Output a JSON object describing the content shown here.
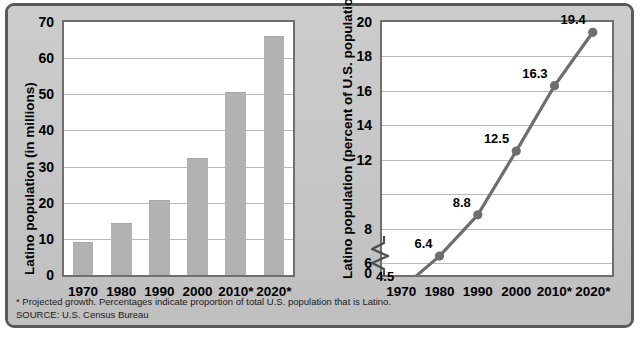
{
  "figure": {
    "background_color": "#c9c9c9",
    "frame_color": "#5a5a5c",
    "footnote_line1": "* Projected growth. Percentages indicate proportion of total U.S. population that is Latino.",
    "footnote_line2": "SOURCE: U.S. Census Bureau"
  },
  "chart_data": [
    {
      "type": "bar",
      "title": "",
      "xlabel": "",
      "ylabel": "Latino population (in millions)",
      "categories": [
        "1970",
        "1980",
        "1990",
        "2000",
        "2010*",
        "2020*"
      ],
      "values": [
        9,
        14,
        20.5,
        32,
        50.5,
        66
      ],
      "ylim": [
        0,
        70
      ],
      "yticks": [
        0,
        10,
        20,
        30,
        40,
        50,
        60,
        70
      ],
      "ytick_labels": [
        "0",
        "10",
        "20",
        "30",
        "40",
        "50",
        "60",
        "70"
      ],
      "grid": true,
      "legend": "none",
      "bar_color": "#b2b2b2",
      "plot_background": "#ffffff",
      "axis_color": "#6f6f70"
    },
    {
      "type": "line",
      "title": "",
      "xlabel": "",
      "ylabel": "Latino population (percent of U.S. population)",
      "categories": [
        "1970",
        "1980",
        "1990",
        "2000",
        "2010*",
        "2020*"
      ],
      "values": [
        4.5,
        6.4,
        8.8,
        12.5,
        16.3,
        19.4
      ],
      "point_labels": [
        "4.5",
        "6.4",
        "8.8",
        "12.5",
        "16.3",
        "19.4"
      ],
      "ylim": [
        5.3,
        20
      ],
      "yticks": [
        6,
        8,
        10,
        12,
        14,
        16,
        18,
        20
      ],
      "ytick_labels": [
        "6",
        "8",
        "",
        "12",
        "14",
        "16",
        "18",
        "20"
      ],
      "axis_break": true,
      "axis_break_label": "0",
      "grid": true,
      "legend": "none",
      "line_color": "#6e6e6e",
      "marker_color": "#6e6e6e",
      "plot_background": "#ffffff",
      "axis_color": "#6f6f70"
    }
  ]
}
